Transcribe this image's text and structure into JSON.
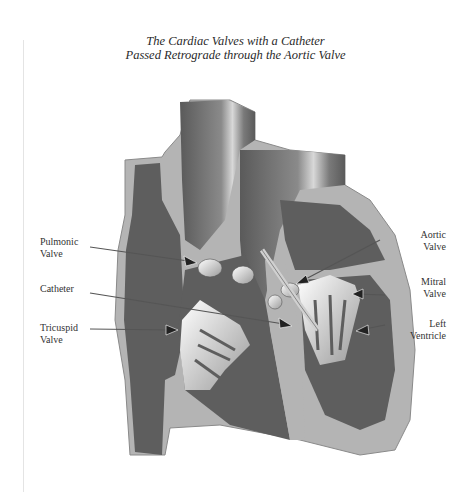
{
  "title": {
    "line1": "The Cardiac Valves with a Catheter",
    "line2": "Passed Retrograde through the Aortic Valve"
  },
  "labels": {
    "pulmonic_valve": {
      "line1": "Pulmonic",
      "line2": "Valve"
    },
    "catheter": {
      "line1": "Catheter"
    },
    "tricuspid_valve": {
      "line1": "Tricuspid",
      "line2": "Valve"
    },
    "aortic_valve": {
      "line1": "Aortic",
      "line2": "Valve"
    },
    "mitral_valve": {
      "line1": "Mitral",
      "line2": "Valve"
    },
    "left_ventricle": {
      "line1": "Left",
      "line2": "Ventricle"
    }
  },
  "colors": {
    "wall_light": "#b4b4b4",
    "chamber_dark": "#5e5e5e",
    "vessel_mid": "#7a7a7a",
    "valve_white": "#f2f2f2",
    "text": "#333333"
  }
}
